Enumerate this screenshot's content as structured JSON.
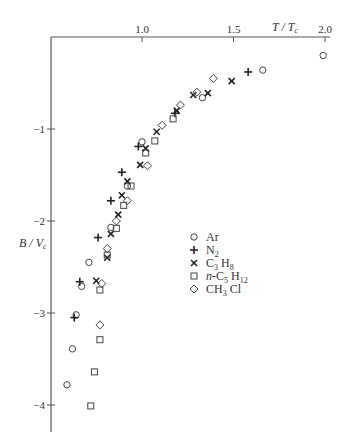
{
  "chart_data": {
    "type": "scatter",
    "title": "",
    "xlabel": "T/T_c",
    "ylabel": "B/V_c",
    "xlabel_display": "T / Tc",
    "ylabel_display": "B / Vc",
    "x_axis_position": "top",
    "xlim": [
      0.5,
      2.05
    ],
    "ylim": [
      -4.2,
      0
    ],
    "x_ticks": [
      1.0,
      1.5,
      2.0
    ],
    "x_tick_labels": [
      "1.0",
      "1.5",
      "2.0"
    ],
    "y_ticks": [
      -1,
      -2,
      -3,
      -4
    ],
    "y_tick_labels": [
      "−1",
      "−2",
      "−3",
      "−4"
    ],
    "grid": false,
    "legend_position": "center-right",
    "series": [
      {
        "name": "Ar",
        "label_main": "Ar",
        "label_sub": "",
        "label_main2": "",
        "label_sub2": "",
        "marker": "circle",
        "points": [
          [
            1.99,
            -0.2
          ],
          [
            1.66,
            -0.36
          ],
          [
            1.33,
            -0.66
          ],
          [
            1.0,
            -1.14
          ],
          [
            0.92,
            -1.62
          ],
          [
            0.83,
            -2.07
          ],
          [
            0.71,
            -2.45
          ],
          [
            0.67,
            -2.71
          ],
          [
            0.64,
            -3.02
          ],
          [
            0.62,
            -3.39
          ],
          [
            0.59,
            -3.78
          ]
        ]
      },
      {
        "name": "N2",
        "label_main": "N",
        "label_sub": "2",
        "label_main2": "",
        "label_sub2": "",
        "marker": "plus",
        "points": [
          [
            1.58,
            -0.38
          ],
          [
            1.18,
            -0.83
          ],
          [
            0.98,
            -1.19
          ],
          [
            0.89,
            -1.47
          ],
          [
            0.83,
            -1.78
          ],
          [
            0.76,
            -2.18
          ],
          [
            0.66,
            -2.66
          ],
          [
            0.63,
            -3.05
          ]
        ]
      },
      {
        "name": "C3H8",
        "label_main": "C",
        "label_sub": "3",
        "label_main2": " H",
        "label_sub2": "8",
        "marker": "cross",
        "points": [
          [
            1.49,
            -0.48
          ],
          [
            1.36,
            -0.61
          ],
          [
            1.28,
            -0.63
          ],
          [
            1.19,
            -0.8
          ],
          [
            1.08,
            -1.03
          ],
          [
            1.02,
            -1.21
          ],
          [
            0.99,
            -1.39
          ],
          [
            0.92,
            -1.57
          ],
          [
            0.89,
            -1.72
          ],
          [
            0.87,
            -1.93
          ],
          [
            0.83,
            -2.14
          ],
          [
            0.81,
            -2.4
          ],
          [
            0.75,
            -2.65
          ]
        ]
      },
      {
        "name": "n-C5H12",
        "label_main": "n-C",
        "label_sub": "5",
        "label_main2": " H",
        "label_sub2": "12",
        "marker": "square",
        "points": [
          [
            1.17,
            -0.89
          ],
          [
            1.07,
            -1.13
          ],
          [
            1.02,
            -1.26
          ],
          [
            0.94,
            -1.62
          ],
          [
            0.9,
            -1.83
          ],
          [
            0.86,
            -2.08
          ],
          [
            0.81,
            -2.37
          ],
          [
            0.77,
            -2.75
          ],
          [
            0.77,
            -3.29
          ],
          [
            0.74,
            -3.64
          ],
          [
            0.72,
            -4.01
          ]
        ]
      },
      {
        "name": "CH3Cl",
        "label_main": "CH",
        "label_sub": "3",
        "label_main2": " Cl",
        "label_sub2": "",
        "marker": "diamond",
        "points": [
          [
            1.39,
            -0.45
          ],
          [
            1.3,
            -0.6
          ],
          [
            1.21,
            -0.74
          ],
          [
            1.11,
            -0.96
          ],
          [
            1.03,
            -1.4
          ],
          [
            0.92,
            -1.78
          ],
          [
            0.86,
            -2.0
          ],
          [
            0.81,
            -2.3
          ],
          [
            0.78,
            -2.68
          ],
          [
            0.77,
            -3.13
          ]
        ]
      }
    ]
  }
}
